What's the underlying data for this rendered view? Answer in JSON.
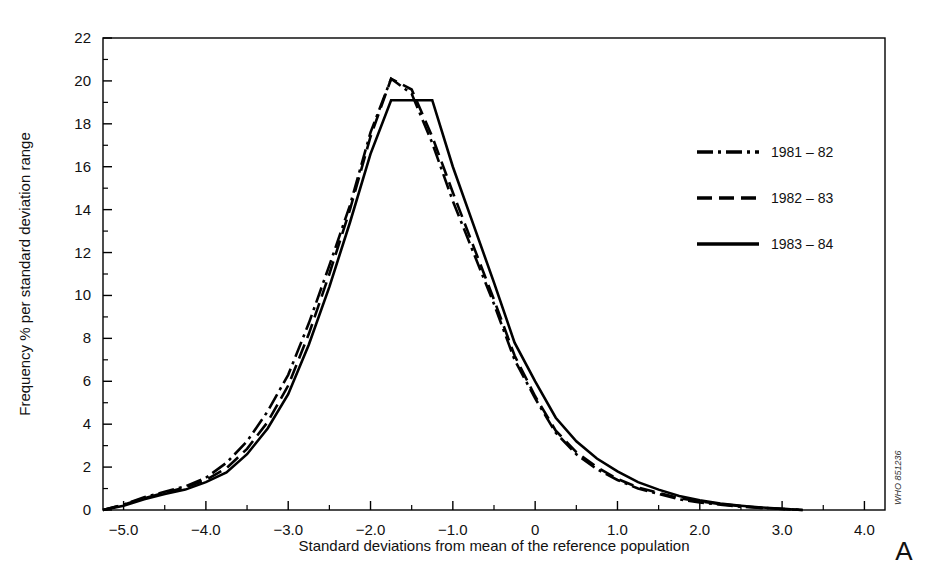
{
  "figure": {
    "panel_letter": "A",
    "credit": "WHO 851236",
    "background_color": "#ffffff",
    "ink_color": "#000000"
  },
  "chart_data": {
    "type": "line",
    "title": "",
    "xlabel": "Standard deviations from mean of the reference population",
    "ylabel": "Frequency % per standard deviation range",
    "xlim": [
      -5.25,
      4.25
    ],
    "ylim": [
      0,
      22
    ],
    "xticks": [
      -5.0,
      -4.0,
      -3.0,
      -2.0,
      -1.0,
      0,
      1.0,
      2.0,
      3.0,
      4.0
    ],
    "xtick_labels": [
      "−5.0",
      "−4.0",
      "−3.0",
      "−2.0",
      "−1.0",
      "0",
      "1.0",
      "2.0",
      "3.0",
      "4.0"
    ],
    "x_minor_step": 0.5,
    "yticks": [
      0,
      2,
      4,
      6,
      8,
      10,
      12,
      14,
      16,
      18,
      20,
      22
    ],
    "ytick_labels": [
      "0",
      "2",
      "4",
      "6",
      "8",
      "10",
      "12",
      "14",
      "16",
      "18",
      "20",
      "22"
    ],
    "y_minor_step": 1,
    "grid": false,
    "legend_position": "right",
    "series": [
      {
        "name": "1981 – 82",
        "style": "dash-dot",
        "dasharray": "16 5 3 5",
        "x": [
          -5.25,
          -5.0,
          -4.75,
          -4.5,
          -4.25,
          -4.0,
          -3.75,
          -3.5,
          -3.25,
          -3.0,
          -2.75,
          -2.5,
          -2.25,
          -2.0,
          -1.75,
          -1.5,
          -1.25,
          -1.0,
          -0.75,
          -0.5,
          -0.25,
          0.0,
          0.25,
          0.5,
          0.75,
          1.0,
          1.25,
          1.5,
          1.75,
          2.0,
          2.25,
          2.5,
          2.75,
          3.0,
          3.25
        ],
        "y": [
          0.0,
          0.25,
          0.6,
          0.85,
          1.1,
          1.5,
          2.2,
          3.2,
          4.6,
          6.3,
          8.7,
          11.4,
          14.2,
          17.6,
          20.1,
          19.4,
          17.1,
          14.4,
          12.0,
          9.6,
          7.0,
          5.2,
          3.6,
          2.6,
          1.9,
          1.4,
          1.0,
          0.75,
          0.5,
          0.35,
          0.25,
          0.15,
          0.1,
          0.05,
          0.0
        ]
      },
      {
        "name": "1982 – 83",
        "style": "dashed",
        "dasharray": "15 7",
        "x": [
          -5.25,
          -5.0,
          -4.75,
          -4.5,
          -4.25,
          -4.0,
          -3.75,
          -3.5,
          -3.25,
          -3.0,
          -2.75,
          -2.5,
          -2.25,
          -2.0,
          -1.75,
          -1.5,
          -1.25,
          -1.0,
          -0.75,
          -0.5,
          -0.25,
          0.0,
          0.25,
          0.5,
          0.75,
          1.0,
          1.25,
          1.5,
          1.75,
          2.0,
          2.25,
          2.5,
          2.75,
          3.0,
          3.25
        ],
        "y": [
          0.0,
          0.25,
          0.55,
          0.8,
          1.05,
          1.4,
          1.95,
          2.85,
          4.1,
          5.8,
          8.2,
          11.0,
          14.0,
          17.4,
          20.1,
          19.6,
          17.4,
          14.8,
          12.3,
          9.8,
          7.2,
          5.3,
          3.7,
          2.7,
          2.0,
          1.45,
          1.05,
          0.8,
          0.55,
          0.4,
          0.28,
          0.18,
          0.1,
          0.05,
          0.0
        ]
      },
      {
        "name": "1983 – 84",
        "style": "solid",
        "dasharray": "",
        "x": [
          -5.25,
          -5.0,
          -4.75,
          -4.5,
          -4.25,
          -4.0,
          -3.75,
          -3.5,
          -3.25,
          -3.0,
          -2.75,
          -2.5,
          -2.25,
          -2.0,
          -1.75,
          -1.5,
          -1.25,
          -1.0,
          -0.75,
          -0.5,
          -0.25,
          0.0,
          0.25,
          0.5,
          0.75,
          1.0,
          1.25,
          1.5,
          1.75,
          2.0,
          2.25,
          2.5,
          2.75,
          3.0,
          3.25
        ],
        "y": [
          0.0,
          0.2,
          0.5,
          0.75,
          0.95,
          1.3,
          1.75,
          2.6,
          3.8,
          5.4,
          7.7,
          10.4,
          13.4,
          16.6,
          19.1,
          19.1,
          19.1,
          16.0,
          13.3,
          10.6,
          7.8,
          6.0,
          4.3,
          3.2,
          2.4,
          1.8,
          1.3,
          0.95,
          0.65,
          0.45,
          0.3,
          0.2,
          0.12,
          0.06,
          0.0
        ]
      }
    ]
  }
}
